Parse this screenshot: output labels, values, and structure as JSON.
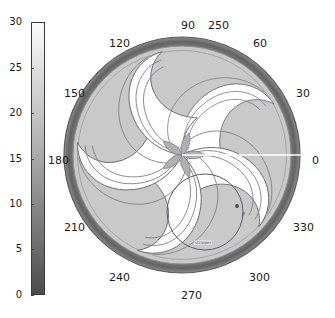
{
  "chart_data": {
    "type": "heatmap",
    "subtype": "polar-contour",
    "title": "",
    "value_label": "250",
    "colorbar": {
      "label": "",
      "min": 0,
      "max": 30,
      "ticks": [
        0,
        5,
        10,
        15,
        20,
        25,
        30
      ],
      "tick_labels": [
        "0",
        "5",
        "10",
        "15",
        "20",
        "25",
        "30"
      ],
      "colormap": "gray",
      "orientation": "vertical",
      "position": "left"
    },
    "angular_axis": {
      "unit": "degrees",
      "tick_values": [
        0,
        30,
        60,
        90,
        120,
        150,
        180,
        210,
        240,
        270,
        300,
        330
      ],
      "tick_labels": [
        "0",
        "30",
        "60",
        "90",
        "120",
        "150",
        "180",
        "210",
        "240",
        "270",
        "300",
        "330"
      ],
      "zero_direction": "east",
      "direction": "counterclockwise"
    },
    "radial_axis": {
      "min": 0,
      "max": 1,
      "ticks_shown": false
    },
    "grid": false,
    "legend": false,
    "features": {
      "pattern": "five-arm-spiral-pinwheel",
      "arm_count": 5,
      "outer_rim": "dark annulus",
      "reference_line": {
        "angle": 0,
        "color": "#ffffff",
        "from_center": true
      }
    },
    "contour_levels": [
      {
        "value": 22,
        "fill": "#ffffff"
      },
      {
        "value": 14,
        "fill": "#c9c9c9"
      },
      {
        "value": 9,
        "fill": "#b3b3b3"
      },
      {
        "value": 4,
        "fill": "#7d7d7d"
      }
    ],
    "overlay": {
      "circle": {
        "center_angle_deg": 305,
        "radius_fraction": 0.37
      },
      "point_marker": {
        "label": "P"
      },
      "annotation": "stripper"
    }
  },
  "colorbar_ticks": [
    {
      "label": "30",
      "frac": 1.0
    },
    {
      "label": "25",
      "frac": 0.8333
    },
    {
      "label": "20",
      "frac": 0.6667
    },
    {
      "label": "15",
      "frac": 0.5
    },
    {
      "label": "10",
      "frac": 0.3333
    },
    {
      "label": "5",
      "frac": 0.1667
    },
    {
      "label": "0",
      "frac": 0.0
    }
  ],
  "angle_labels": [
    {
      "text": "0",
      "x": 252,
      "y": 155
    },
    {
      "text": "30",
      "x": 236,
      "y": 88
    },
    {
      "text": "60",
      "x": 193,
      "y": 38
    },
    {
      "text": "90",
      "x": 121,
      "y": 20
    },
    {
      "text": "120",
      "x": 49,
      "y": 38
    },
    {
      "text": "150",
      "x": 4,
      "y": 88
    },
    {
      "text": "180",
      "x": -12,
      "y": 155
    },
    {
      "text": "210",
      "x": 4,
      "y": 222
    },
    {
      "text": "240",
      "x": 49,
      "y": 272
    },
    {
      "text": "270",
      "x": 121,
      "y": 290
    },
    {
      "text": "300",
      "x": 189,
      "y": 272
    },
    {
      "text": "330",
      "x": 233,
      "y": 222
    }
  ],
  "value_label_pos": {
    "x": 148,
    "y": 20
  },
  "annotation_pos": {
    "x": 134,
    "y": 240
  },
  "point_label_pos": {
    "x": 182,
    "y": 212
  },
  "colors": {
    "background": "#ffffff",
    "text": "#1a1a1a",
    "level_white": "#ffffff",
    "level_light": "#c9c9c9",
    "level_mid": "#b3b3b3",
    "rim_dark": "#6f6f6f",
    "contour_line": "#6b6b75",
    "reference_line": "#ffffff",
    "overlay_line": "#5a5a68"
  }
}
